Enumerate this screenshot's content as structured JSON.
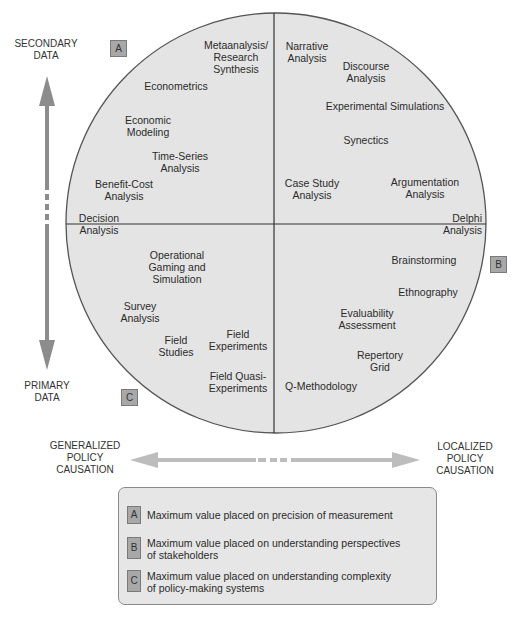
{
  "axes": {
    "vertical": {
      "top_label": "SECONDARY\nDATA",
      "bottom_label": "PRIMARY\nDATA"
    },
    "horizontal": {
      "left_label": "GENERALIZED\nPOLICY\nCAUSATION",
      "right_label": "LOCALIZED\nPOLICY\nCAUSATION"
    }
  },
  "quadrant_tags": {
    "a": "A",
    "b": "B",
    "c": "C"
  },
  "methods": {
    "upper_left": [
      {
        "label": "Metaanalysis/\nResearch\nSynthesis"
      },
      {
        "label": "Econometrics"
      },
      {
        "label": "Economic\nModeling"
      },
      {
        "label": "Time-Series\nAnalysis"
      },
      {
        "label": "Benefit-Cost\nAnalysis"
      },
      {
        "label": "Decision\nAnalysis"
      }
    ],
    "upper_right": [
      {
        "label": "Narrative\nAnalysis"
      },
      {
        "label": "Discourse\nAnalysis"
      },
      {
        "label": "Experimental Simulations"
      },
      {
        "label": "Synectics"
      },
      {
        "label": "Case Study\nAnalysis"
      },
      {
        "label": "Argumentation\nAnalysis"
      },
      {
        "label": "Delphi\nAnalysis"
      }
    ],
    "lower_left": [
      {
        "label": "Operational\nGaming and\nSimulation"
      },
      {
        "label": "Survey\nAnalysis"
      },
      {
        "label": "Field\nStudies"
      },
      {
        "label": "Field\nExperiments"
      },
      {
        "label": "Field Quasi-\nExperiments"
      }
    ],
    "lower_right": [
      {
        "label": "Brainstorming"
      },
      {
        "label": "Ethnography"
      },
      {
        "label": "Evaluability\nAssessment"
      },
      {
        "label": "Repertory\nGrid"
      },
      {
        "label": "Q-Methodology"
      }
    ]
  },
  "legend": [
    {
      "tag": "A",
      "text": "Maximum value placed on precision of measurement"
    },
    {
      "tag": "B",
      "text": "Maximum value placed on understanding perspectives\nof stakeholders"
    },
    {
      "tag": "C",
      "text": "Maximum value placed on understanding complexity\nof policy-making systems"
    }
  ],
  "colors": {
    "circle_fill": "#e4e4e4",
    "circle_stroke": "#555555",
    "arrow": "#8c8c8c",
    "h_arrow": "#bdbdbd",
    "tag_fill": "#a8a8a8",
    "legend_fill": "#e6e6e6"
  }
}
